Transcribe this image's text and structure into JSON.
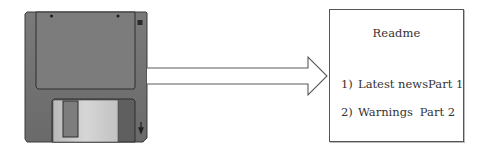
{
  "diagram": {
    "source": {
      "label": "floppy-disk",
      "colors": {
        "body": "#6e6e6e",
        "label_area": "#787878",
        "shutter": "#c9c9c9",
        "outline": "#333333"
      }
    },
    "connector": {
      "type": "block-arrow",
      "direction": "right",
      "color": "#555555"
    },
    "target": {
      "title": "Readme",
      "items": [
        {
          "number": "1)",
          "label": "Latest news",
          "part": "Part 1"
        },
        {
          "number": "2)",
          "label": "Warnings",
          "part": "Part 2"
        }
      ]
    }
  }
}
